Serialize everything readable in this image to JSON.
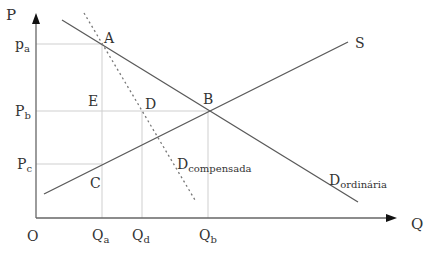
{
  "diagram": {
    "type": "economics supply-demand diagram",
    "axes": {
      "y_label": "P",
      "x_label": "Q",
      "origin_label": "O"
    },
    "price_labels": [
      {
        "main": "p",
        "sub": "a"
      },
      {
        "main": "P",
        "sub": "b"
      },
      {
        "main": "P",
        "sub": "c"
      }
    ],
    "quantity_labels": [
      {
        "main": "Q",
        "sub": "a"
      },
      {
        "main": "Q",
        "sub": "d"
      },
      {
        "main": "Q",
        "sub": "b"
      }
    ],
    "points": {
      "A": "A",
      "B": "B",
      "C": "C",
      "D": "D",
      "E": "E"
    },
    "curves": {
      "supply": {
        "label": "S"
      },
      "ordinary_demand": {
        "main": "D",
        "sub": "ordinária"
      },
      "compensated_demand": {
        "main": "D",
        "sub": "compensada"
      }
    },
    "colors": {
      "line": "#555555",
      "guide": "#cccccc",
      "text": "#333333"
    }
  }
}
